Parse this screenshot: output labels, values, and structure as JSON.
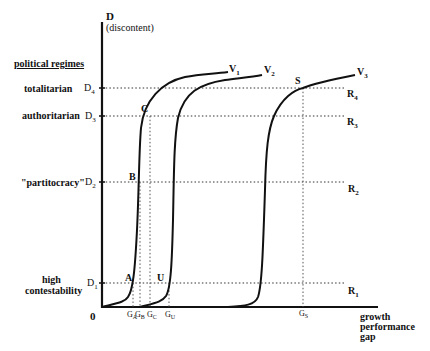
{
  "diagram": {
    "y_axis": {
      "label": "D",
      "sublabel": "(discontent)"
    },
    "x_axis": {
      "label_lines": [
        "growth",
        "performance",
        "gap"
      ],
      "origin": "0"
    },
    "regimes_heading": "political regimes",
    "regimes": [
      {
        "name": "totalitarian",
        "level": "D",
        "sub": "4",
        "right": "R",
        "right_sub": "4"
      },
      {
        "name": "authoritarian",
        "level": "D",
        "sub": "3",
        "right": "R",
        "right_sub": "3"
      },
      {
        "name": "\"partitocracy\"",
        "level": "D",
        "sub": "2",
        "right": "R",
        "right_sub": "2"
      },
      {
        "name_lines": [
          "high",
          "contestability"
        ],
        "level": "D",
        "sub": "1",
        "right": "R",
        "right_sub": "1"
      }
    ],
    "curves": [
      {
        "label": "V",
        "sub": "1"
      },
      {
        "label": "V",
        "sub": "2"
      },
      {
        "label": "V",
        "sub": "3"
      }
    ],
    "points": {
      "A": "A",
      "B": "B",
      "C": "C",
      "U": "U",
      "S": "S"
    },
    "x_ticks": [
      {
        "label": "G",
        "sub": "A"
      },
      {
        "label": "G",
        "sub": "B"
      },
      {
        "label": "G",
        "sub": "C"
      },
      {
        "label": "G",
        "sub": "U"
      },
      {
        "label": "G",
        "sub": "S"
      }
    ]
  }
}
